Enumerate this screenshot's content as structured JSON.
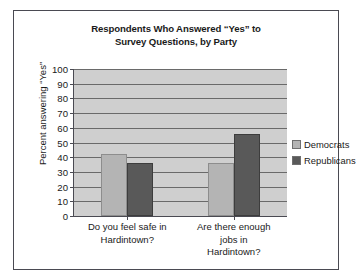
{
  "chart_data": {
    "type": "bar",
    "title": "Respondents Who Answered “Yes” to Survey Questions, by Party",
    "title_lines": [
      "Respondents Who Answered “Yes” to",
      "Survey Questions, by Party"
    ],
    "xlabel": "",
    "ylabel": "Percent answering “Yes”",
    "ylim": [
      0,
      100
    ],
    "ytick_step": 10,
    "yticks": [
      0,
      10,
      20,
      30,
      40,
      50,
      60,
      70,
      80,
      90,
      100
    ],
    "ytick_labels": [
      "0",
      "10",
      "20",
      "30",
      "40",
      "50",
      "60",
      "70",
      "80",
      "90",
      "100"
    ],
    "grid": true,
    "grid_axis": "y",
    "legend_position": "right",
    "categories": [
      "Do you feel safe in Hardintown?",
      "Are there enough jobs in Hardintown?"
    ],
    "category_lines": [
      [
        "Do you feel safe in",
        "Hardintown?"
      ],
      [
        "Are there enough",
        "jobs in",
        "Hardintown?"
      ]
    ],
    "series": [
      {
        "name": "Democrats",
        "color": "#b4b4b4",
        "values": [
          42,
          36
        ]
      },
      {
        "name": "Republicans",
        "color": "#595959",
        "values": [
          36,
          56
        ]
      }
    ],
    "plot_background": "#cfcfcf",
    "gridline_color": "#6a6a6a",
    "axis_color": "#4a4a52",
    "border_color": "#4a4a52"
  }
}
